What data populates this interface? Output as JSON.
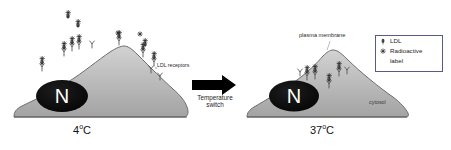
{
  "figure": {
    "title_visible": false,
    "background_color": "#ffffff",
    "panels": [
      {
        "id": "left-panel",
        "condition_label": "4",
        "condition_unit": "C",
        "condition_full": "4°C",
        "description": "LDL receptors with bound radiolabeled LDL remain on the cell surface",
        "cell_fill": "#b9b9b9",
        "nucleus_label": "N",
        "nucleus_color": "#111111",
        "surface_complex_count": 8,
        "internal_complex_count": 0
      },
      {
        "id": "right-panel",
        "condition_label": "37",
        "condition_unit": "C",
        "condition_full": "37°C",
        "description": "Receptor-LDL complexes internalized into the cytosol",
        "cell_fill": "#b9b9b9",
        "nucleus_label": "N",
        "nucleus_color": "#111111",
        "surface_complex_count": 0,
        "internal_complex_count": 3
      }
    ],
    "annotations": {
      "ldl_receptors": "LDL receptors",
      "plasma_membrane": "plasma membrane",
      "cytosol": "cytosol"
    },
    "transition": {
      "arrow_icon": "right-arrow-icon",
      "caption_line1": "Temperature",
      "caption_line2": "switch",
      "arrow_color": "#000000"
    },
    "legend": {
      "border_color": "#5a5a8a",
      "items": [
        {
          "icon": "ldl-particle-icon",
          "label": "LDL"
        },
        {
          "icon": "radioactive-asterisk-icon",
          "label": "Radioactive"
        },
        {
          "icon": "",
          "label": "label"
        }
      ]
    },
    "colors": {
      "cell_fill_light": "#c9c9c9",
      "cell_fill_dark": "#a7a7a7",
      "cell_outline": "#6f6f6f",
      "nucleus": "#111111",
      "glyph_dark": "#3c3c3c",
      "text": "#1a1a1a"
    }
  }
}
